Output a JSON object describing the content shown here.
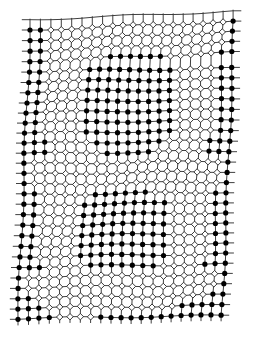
{
  "figure": {
    "digit": "8",
    "colors": {
      "background": "#ffffff",
      "line": "#2a2a2a",
      "filled_dot": "#000000",
      "hollow_dot_fill": "#ffffff",
      "hollow_dot_stroke": "#222222"
    },
    "grid": {
      "cols": 21,
      "rows": 29,
      "origin_x": 28,
      "origin_y": 30,
      "spacing_x": 10.2,
      "spacing_y": 10.3,
      "legend": {
        "W": "hollow white marker",
        "B": "filled black marker"
      },
      "matrix": [
        "BBWWWWWWWWWWWWWWWWWWB",
        "BBWWWWWWWWWWWWWWWWWWB",
        "BBWWWWWWWWWWWWWWWWWWB",
        "BBWWWWWWBBBBBBWWWWWBB",
        "BBWWWWBBBBBBBBBWWWWBB",
        "BBWWWWBBBBBBBBBWWWWBB",
        "BBWWWWBBBBBBBBBWWWWBB",
        "BBWWWWBBBBBBBBBWWWWBB",
        "BBWWWWBBBBBBBBBWWWWBB",
        "BBWWWWBBBBBBBBBWWWWBB",
        "BBWWWWBBBBBBBBBWWWWBB",
        "BBBWWWWBBBBBBBWWWWBBB",
        "BBBWWWWWBBBBBWWWWWBBB",
        "BWWWWWWWWWWWWWWWWWWWB",
        "BWWWWWWWWWWWWWWWWWWWB",
        "BWWWWWWWWWWWWWWWWWWWB",
        "BBWWWWWBBBBBBWWWWWWBB",
        "BBWWWWBBBBBBBBBWWWWBB",
        "BBWWWWBBBBBBBBBWWWWBB",
        "BBWWWWBBBBBBBBBWWWWBB",
        "BBWWWWBBBBBBBBBWWWWBB",
        "BBWWWWBBBBBBBBBWWWWBB",
        "BBWWWWBBBBBBBBBWWWWBB",
        "BBBWWWWBBBBBBBWWWWBBB",
        "BWWWWWWWWWWWWWWWWWWWB",
        "BWWWWWWWWWWWWWWWWWWWB",
        "BBWWWWWWWWWWWWWWWWWBB",
        "BBBWWWWWWWWWWWWWBBBBB",
        "BBBBWWWWBBBBBBBBBBBBB"
      ],
      "warp": {
        "row_tilt_px": -0.35,
        "col_slant_px": 0.12,
        "top_left_x": 30,
        "bottom_left_x": 18
      }
    }
  }
}
